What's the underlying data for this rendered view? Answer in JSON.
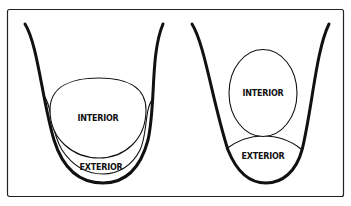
{
  "diagram": {
    "left_panel": {
      "interior_label": "INTERIOR",
      "exterior_label": "EXTERIOR"
    },
    "right_panel": {
      "interior_label": "INTERIOR",
      "exterior_label": "EXTERIOR"
    },
    "colors": {
      "stroke": "#111111",
      "background": "#ffffff"
    }
  }
}
